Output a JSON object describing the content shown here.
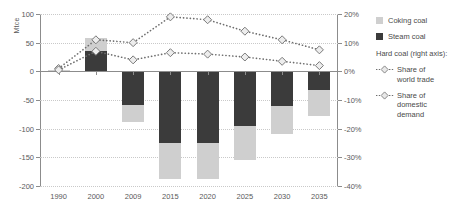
{
  "chart_data": {
    "type": "bar",
    "title": "",
    "xlabel": "",
    "ylabel": "Mtce",
    "y2label": "",
    "categories": [
      "1990",
      "2000",
      "2009",
      "2015",
      "2020",
      "2025",
      "2030",
      "2035"
    ],
    "ylim": [
      -200,
      100
    ],
    "yticks": [
      100,
      50,
      0,
      -50,
      -100,
      -150,
      -200
    ],
    "ytick_labels": [
      "100",
      "50",
      "0",
      "-50",
      "-100",
      "-150",
      "-200"
    ],
    "y2lim": [
      -40,
      20
    ],
    "y2ticks": [
      20,
      10,
      0,
      -10,
      -20,
      -30,
      -40
    ],
    "y2tick_labels": [
      "20%",
      "10%",
      "0%",
      "-10%",
      "-20%",
      "-30%",
      "-40%"
    ],
    "grid": true,
    "legend_position": "right",
    "stacked": true,
    "series": [
      {
        "name": "Steam coal",
        "axis": "left",
        "kind": "bar",
        "color": "#3b3b3b",
        "values": [
          2,
          35,
          -58,
          -125,
          -125,
          -95,
          -60,
          -33
        ]
      },
      {
        "name": "Coking coal",
        "axis": "left",
        "kind": "bar",
        "color": "#cfcfcf",
        "values": [
          1,
          23,
          -31,
          -63,
          -63,
          -60,
          -50,
          -45
        ]
      },
      {
        "name": "Share of world trade",
        "axis": "right",
        "kind": "line",
        "color": "#6e6e6e",
        "marker": "diamond",
        "values": [
          1.0,
          11.0,
          10.0,
          19.0,
          18.0,
          14.0,
          11.0,
          7.5
        ]
      },
      {
        "name": "Share of domestic demand",
        "axis": "right",
        "kind": "line",
        "color": "#6e6e6e",
        "marker": "diamond",
        "values": [
          0.5,
          7.0,
          4.0,
          6.5,
          6.0,
          5.0,
          3.5,
          2.0
        ]
      }
    ]
  },
  "legend": {
    "bar_items": [
      {
        "label": "Coking coal",
        "swatch": "coking"
      },
      {
        "label": "Steam coal",
        "swatch": "steam"
      }
    ],
    "group_title": "Hard coal (right axis):",
    "line_items": [
      {
        "label": "Share of\nworld trade",
        "line1": "Share of",
        "line2": "world trade"
      },
      {
        "label": "Share of\ndomestic demand",
        "line1": "Share of",
        "line2": "domestic demand"
      }
    ]
  }
}
